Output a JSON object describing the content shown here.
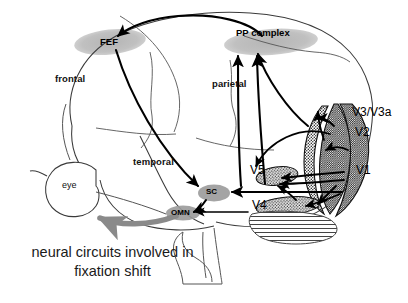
{
  "figure": {
    "caption_line1": "neural circuits involved in",
    "caption_line2": "fixation shift",
    "caption_full": "neural circuits involved in fixation shift",
    "background_color": "#ffffff",
    "ink_color": "#000000",
    "blob_fill_color": "#b3b3b3",
    "stipple_color": "#1a1a1a",
    "omn_arrow_color": "#808080"
  },
  "lobes": [
    {
      "id": "frontal",
      "label": "frontal",
      "x": 55,
      "y": 75
    },
    {
      "id": "parietal",
      "label": "parietal",
      "x": 212,
      "y": 80
    },
    {
      "id": "temporal",
      "label": "temporal",
      "x": 133,
      "y": 158
    }
  ],
  "regions": [
    {
      "id": "fef",
      "label": "FEF",
      "x": 100,
      "y": 39,
      "kind": "gray-blob"
    },
    {
      "id": "pp-complex",
      "label": "PP complex",
      "x": 236,
      "y": 29,
      "kind": "gray-blob"
    },
    {
      "id": "v3-v3a",
      "label": "V3/V3a",
      "x": 352,
      "y": 112,
      "kind": "stipple-band"
    },
    {
      "id": "v2",
      "label": "V2",
      "x": 355,
      "y": 132,
      "kind": "stipple-band"
    },
    {
      "id": "v1",
      "label": "V1",
      "x": 356,
      "y": 170,
      "kind": "stipple-band"
    },
    {
      "id": "v5",
      "label": "V5",
      "x": 253,
      "y": 170,
      "kind": "stipple-patch"
    },
    {
      "id": "v4",
      "label": "V4",
      "x": 256,
      "y": 205,
      "kind": "stipple-patch"
    },
    {
      "id": "sc",
      "label": "SC",
      "x": 205,
      "y": 191,
      "kind": "gray-blob"
    },
    {
      "id": "omn",
      "label": "OMN",
      "x": 172,
      "y": 212,
      "kind": "gray-blob"
    },
    {
      "id": "eye",
      "label": "eye",
      "x": 79,
      "y": 186,
      "kind": "outline-circle"
    }
  ],
  "connections": [
    {
      "from": "pp-complex",
      "to": "fef",
      "style": "solid-arrow"
    },
    {
      "from": "v3-v3a",
      "to": "pp-complex",
      "style": "solid-arrow"
    },
    {
      "from": "v5",
      "to": "pp-complex",
      "style": "solid-arrow"
    },
    {
      "from": "fef",
      "to": "sc",
      "style": "solid-arrow"
    },
    {
      "from": "v1",
      "to": "v2",
      "style": "solid-arrow"
    },
    {
      "from": "v2",
      "to": "v3-v3a",
      "style": "solid-arrow"
    },
    {
      "from": "v1",
      "to": "v5",
      "style": "solid-arrow"
    },
    {
      "from": "v1",
      "to": "v4",
      "style": "solid-arrow"
    },
    {
      "from": "v4",
      "to": "v5",
      "style": "solid-arrow"
    },
    {
      "from": "v1",
      "to": "sc",
      "style": "solid-arrow"
    },
    {
      "from": "sc",
      "to": "omn",
      "style": "solid-arrow"
    },
    {
      "from": "omn",
      "to": "eye",
      "style": "thick-gray-arrow"
    },
    {
      "from": "eye",
      "to": "v1",
      "style": "thin-line"
    }
  ]
}
